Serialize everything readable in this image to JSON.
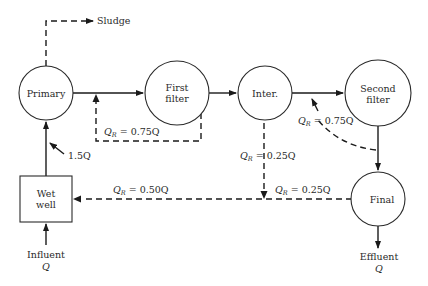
{
  "diagram": {
    "type": "process-flow",
    "nodes": {
      "primary": {
        "label": "Primary"
      },
      "first_filter": {
        "line1": "First",
        "line2": "filter"
      },
      "inter": {
        "label": "Inter."
      },
      "second_filter": {
        "line1": "Second",
        "line2": "filter"
      },
      "final": {
        "label": "Final"
      },
      "wet_well": {
        "line1": "Wet",
        "line2": "well"
      }
    },
    "io": {
      "sludge": "Sludge",
      "influent": {
        "label": "Influent",
        "symbol": "Q"
      },
      "effluent": {
        "label": "Effluent",
        "symbol": "Q"
      }
    },
    "flows": {
      "wetwell_to_primary": "1.5Q",
      "recycle_first": {
        "q": "Q",
        "sub": "R",
        "value": " = 0.75Q"
      },
      "recycle_second": {
        "q": "Q",
        "sub": "R",
        "value": " = 0.75Q"
      },
      "recycle_inter": {
        "q": "Q",
        "sub": "R",
        "value": " = 0.25Q"
      },
      "recycle_final": {
        "q": "Q",
        "sub": "R",
        "value": " = 0.25Q"
      },
      "recycle_wetwell": {
        "q": "Q",
        "sub": "R",
        "value": " = 0.50Q"
      }
    },
    "edges": [
      {
        "from": "Influent",
        "to": "Wet well",
        "style": "solid"
      },
      {
        "from": "Wet well",
        "to": "Primary",
        "style": "solid",
        "label": "1.5Q"
      },
      {
        "from": "Primary",
        "to": "Sludge",
        "style": "dashed"
      },
      {
        "from": "Primary",
        "to": "First filter",
        "style": "solid"
      },
      {
        "from": "First filter",
        "to": "Primary outlet",
        "style": "dashed",
        "label": "QR = 0.75Q"
      },
      {
        "from": "First filter",
        "to": "Inter.",
        "style": "solid"
      },
      {
        "from": "Inter.",
        "to": "Second filter",
        "style": "solid"
      },
      {
        "from": "Second filter outlet",
        "to": "Second filter inlet",
        "style": "dashed",
        "label": "QR = 0.75Q"
      },
      {
        "from": "Second filter",
        "to": "Final",
        "style": "solid"
      },
      {
        "from": "Inter.",
        "to": "Wet well return line",
        "style": "dashed",
        "label": "QR = 0.25Q"
      },
      {
        "from": "Final",
        "to": "Wet well",
        "style": "dashed",
        "label": "QR = 0.25Q / QR = 0.50Q"
      },
      {
        "from": "Final",
        "to": "Effluent",
        "style": "solid"
      }
    ]
  }
}
